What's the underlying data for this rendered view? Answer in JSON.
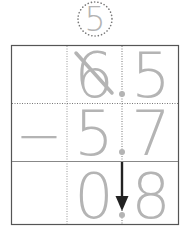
{
  "borrow_note": {
    "value": "5",
    "style": "dotted-circle"
  },
  "problem": {
    "operator": "−",
    "minuend": {
      "whole": "6",
      "decimal_point": ".",
      "tenths": "5",
      "whole_crossed_out": true
    },
    "subtrahend": {
      "whole": "5",
      "decimal_point": ".",
      "tenths": "7"
    },
    "result": {
      "whole": "0",
      "decimal_point": ".",
      "tenths": "8"
    }
  },
  "annotations": {
    "arrow": "decimal point carried straight down"
  },
  "colors": {
    "digits": "#b4b4b4",
    "grid_border": "#555555",
    "dotted_lines": "#888888",
    "arrow": "#222222",
    "background": "#ffffff"
  }
}
